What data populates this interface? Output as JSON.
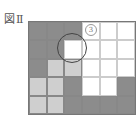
{
  "figure": {
    "label": "図Ⅱ",
    "rows": 5,
    "cols": 6,
    "colors": {
      "dark": "#8c8c8c",
      "light": "#cfcfcf",
      "white": "#ffffff"
    },
    "cells": [
      [
        "dark",
        "dark",
        "dark",
        "white",
        "white",
        "white"
      ],
      [
        "dark",
        "dark",
        "white",
        "white",
        "white",
        "white"
      ],
      [
        "dark",
        "light",
        "light",
        "white",
        "white",
        "white"
      ],
      [
        "light",
        "light",
        "dark",
        "white",
        "white",
        "dark"
      ],
      [
        "light",
        "light",
        "dark",
        "dark",
        "dark",
        "dark"
      ]
    ],
    "marker": {
      "text": "3",
      "row": 0,
      "col": 3
    },
    "circle": {
      "cx": 72,
      "cy": 48,
      "r": 15
    }
  }
}
